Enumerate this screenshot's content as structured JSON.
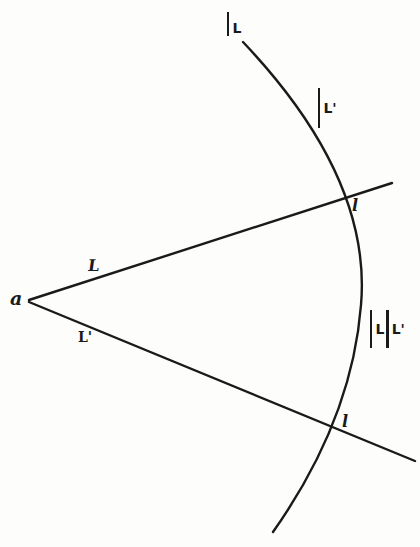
{
  "figure": {
    "type": "geometric-construction",
    "stroke_color": "#1a1a1a",
    "background_color": "#fdfdfb"
  },
  "points": {
    "vertex": {
      "label": "a",
      "x": 29,
      "y": 300
    },
    "upper_intersection": {
      "label": "l",
      "x": 344,
      "y": 196
    },
    "lower_intersection": {
      "label": "l",
      "x": 337,
      "y": 432
    }
  },
  "lines": {
    "upper_ray": {
      "label": "L",
      "x1": 29,
      "y1": 300,
      "x2": 392,
      "y2": 183
    },
    "lower_ray": {
      "label": "L'",
      "x1": 29,
      "y1": 302,
      "x2": 415,
      "y2": 461
    }
  },
  "arc": {
    "start": {
      "x": 243,
      "y": 42
    },
    "mid": {
      "x": 361,
      "y": 305
    },
    "end": {
      "x": 273,
      "y": 532
    }
  },
  "labels": {
    "vertex": "a",
    "upper_ray": "L",
    "lower_ray": "L'",
    "upper_point": "l",
    "lower_point": "l",
    "arc_top": {
      "bar": "|",
      "text": "L"
    },
    "arc_upper": {
      "bar": "|",
      "text": "L'"
    },
    "arc_middle": {
      "bar1": "|",
      "text1": "L",
      "bar2": "|",
      "text2": "L'"
    }
  }
}
